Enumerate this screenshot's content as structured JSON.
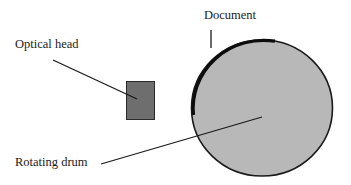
{
  "diagram": {
    "labels": {
      "document": "Document",
      "optical_head": "Optical head",
      "rotating_drum": "Rotating drum"
    },
    "colors": {
      "background": "#ffffff",
      "drum_fill": "#b8b8b8",
      "drum_outline": "#1a1a1a",
      "optical_head_fill": "#6e6e6e",
      "optical_head_outline": "#2a2a2a",
      "document_stroke": "#0d0d0d",
      "leader_line": "#1a1a1a",
      "text": "#1a1a1a"
    },
    "components": [
      {
        "id": "rotating-drum",
        "shape": "circle"
      },
      {
        "id": "document",
        "shape": "arc on drum surface"
      },
      {
        "id": "optical-head",
        "shape": "rectangle"
      }
    ]
  }
}
